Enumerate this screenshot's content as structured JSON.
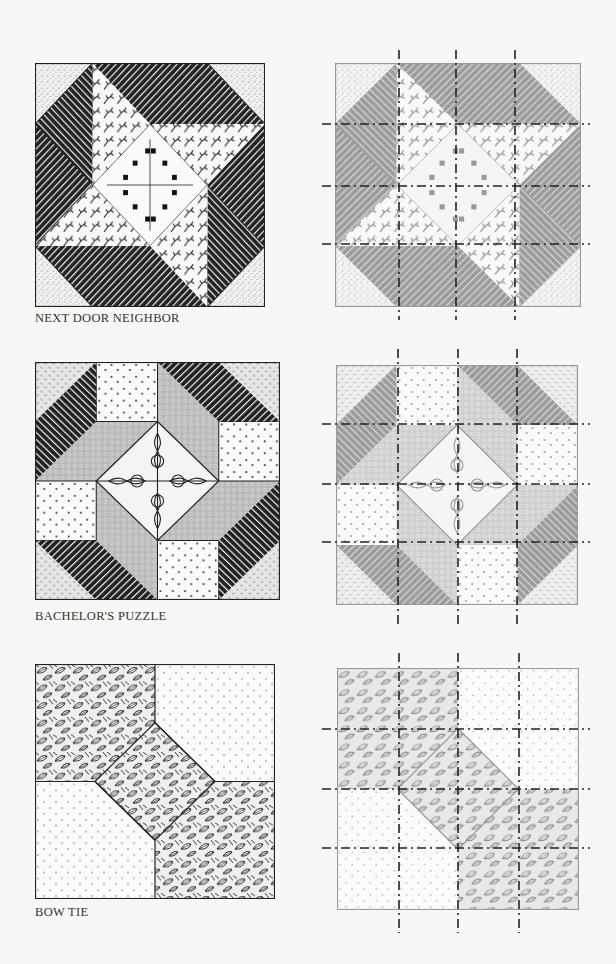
{
  "page": {
    "background": "#f7f7f5"
  },
  "blocks": [
    {
      "name": "Next Door Neighbor",
      "caption": "NEXT DOOR NEIGHBOR",
      "style": "illustrated",
      "fabrics": [
        "dotted corners",
        "dark diagonal stripes",
        "branching sprig print",
        "diamond medallion center"
      ]
    },
    {
      "name": "Bachelor's Puzzle",
      "caption": "BACHELOR'S PUZZLE",
      "style": "illustrated",
      "fabrics": [
        "speckled corners",
        "dark diagonal stripes",
        "heart dot squares",
        "gray textured bands",
        "ornate tile center"
      ]
    },
    {
      "name": "Bow Tie",
      "caption": "BOW TIE",
      "style": "illustrated",
      "fabrics": [
        "leaf print",
        "sparse dot print"
      ]
    }
  ],
  "grid_overlays": [
    {
      "block": "Next Door Neighbor",
      "grid": "4x4 dashed cut lines"
    },
    {
      "block": "Bachelor's Puzzle",
      "grid": "4x4 dashed cut lines"
    },
    {
      "block": "Bow Tie",
      "grid": "4x4 dashed cut lines"
    }
  ],
  "colors": {
    "ink": "#1e1e1e",
    "gray_fill": "#9a9a9a",
    "light_gray": "#c8c8c8",
    "paper": "#fbfbf9",
    "dash": "#222222"
  }
}
